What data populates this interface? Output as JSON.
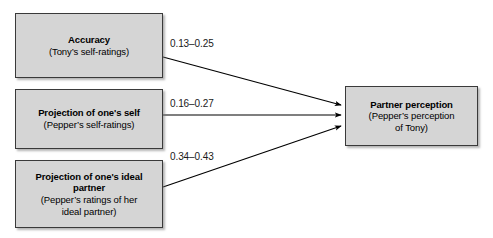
{
  "diagram": {
    "background_color": "#ffffff",
    "box_fill_color": "#d5d5d5",
    "box_border_color": "#3a3a3a",
    "arrow_color": "#000000",
    "nodes": [
      {
        "id": "accuracy",
        "title": "Accuracy",
        "subtitle": "(Tony’s self-ratings)"
      },
      {
        "id": "projection_self",
        "title": "Projection of one's self",
        "subtitle": "(Pepper’s self-ratings)"
      },
      {
        "id": "projection_ideal",
        "title": "Projection of one's ideal partner",
        "subtitle_line1": "(Pepper’s ratings of her",
        "subtitle_line2": "ideal partner)"
      },
      {
        "id": "partner_perception",
        "title": "Partner perception",
        "subtitle_line1": "(Pepper’s perception",
        "subtitle_line2": "of Tony)"
      }
    ],
    "edges": [
      {
        "id": "accuracy_to_partner",
        "from": "accuracy",
        "to": "partner_perception",
        "label": "0.13–0.25"
      },
      {
        "id": "projection_self_to_partner",
        "from": "projection_self",
        "to": "partner_perception",
        "label": "0.16–0.27"
      },
      {
        "id": "projection_ideal_to_partner",
        "from": "projection_ideal",
        "to": "partner_perception",
        "label": "0.34–0.43"
      }
    ]
  }
}
